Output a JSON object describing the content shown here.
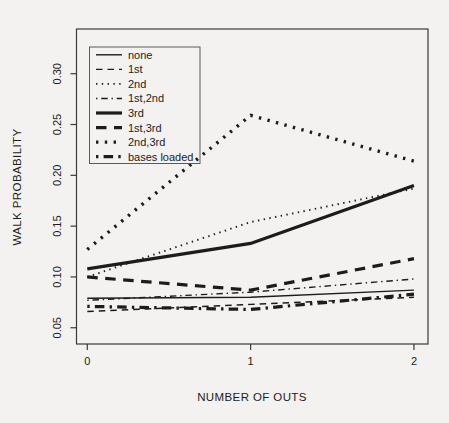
{
  "figure": {
    "background": "#f3f2f0",
    "ink": "#1c1c1c"
  },
  "chart_data": {
    "type": "line",
    "title": "",
    "xlabel": "NUMBER OF OUTS",
    "ylabel": "WALK PROBABILITY",
    "x": [
      0,
      1,
      2
    ],
    "x_tick_labels": [
      "0",
      "1",
      "2"
    ],
    "y_ticks": [
      0.05,
      0.1,
      0.15,
      0.2,
      0.25,
      0.3
    ],
    "y_tick_labels": [
      "0.05",
      "0.10",
      "0.15",
      "0.20",
      "0.25",
      "0.30"
    ],
    "xlim": [
      -0.066,
      2.086
    ],
    "ylim": [
      0.034,
      0.344
    ],
    "grid": false,
    "legend_position": "top-left",
    "series": [
      {
        "name": "none",
        "style": "thin-solid",
        "values": [
          0.079,
          0.08,
          0.087
        ]
      },
      {
        "name": "1st",
        "style": "thin-dashed",
        "values": [
          0.066,
          0.073,
          0.08
        ]
      },
      {
        "name": "2nd",
        "style": "thin-dotted",
        "values": [
          0.1,
          0.154,
          0.187
        ]
      },
      {
        "name": "1st,2nd",
        "style": "thin-dashdot",
        "values": [
          0.077,
          0.085,
          0.098
        ]
      },
      {
        "name": "3rd",
        "style": "thick-solid",
        "values": [
          0.108,
          0.133,
          0.19
        ]
      },
      {
        "name": "1st,3rd",
        "style": "thick-dashed",
        "values": [
          0.1,
          0.087,
          0.118
        ]
      },
      {
        "name": "2nd,3rd",
        "style": "thick-dotted",
        "values": [
          0.127,
          0.259,
          0.214
        ]
      },
      {
        "name": "bases loaded",
        "style": "thick-dashdot",
        "values": [
          0.071,
          0.068,
          0.083
        ]
      }
    ]
  }
}
